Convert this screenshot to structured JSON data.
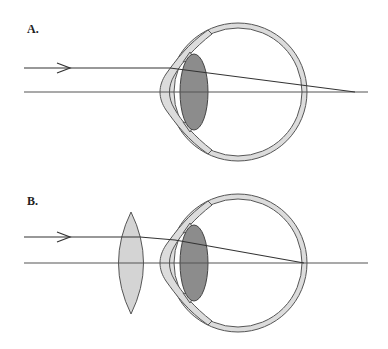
{
  "figure": {
    "panels": [
      {
        "label": "A.",
        "description": "Hyperopic eye: parallel rays focus behind the retina",
        "ray_y": 68,
        "axis_y": 92,
        "eye_center": [
          238,
          92
        ],
        "focus_point": [
          355,
          92
        ],
        "has_corrective_lens": false
      },
      {
        "label": "B.",
        "description": "Convex (converging) corrective lens brings focus onto the retina",
        "ray_y": 237,
        "axis_y": 263,
        "eye_center": [
          238,
          263
        ],
        "focus_point": [
          304,
          263
        ],
        "has_corrective_lens": true,
        "corrective_lens_center": [
          131,
          263
        ]
      }
    ],
    "colors": {
      "sclera": "#dcdcdc",
      "crystalline_lens": "#8c8c8c",
      "corrective_lens": "#d4d4d4",
      "lines": "#333333"
    },
    "icons": {
      "ray_arrow": "arrow-right-icon"
    }
  }
}
